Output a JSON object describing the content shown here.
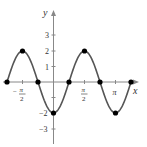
{
  "chart_data": {
    "type": "line",
    "function": "y = -2cos(2x)",
    "title": "",
    "xlabel": "x",
    "ylabel": "y",
    "xlim": [
      -2.356,
      3.927
    ],
    "ylim": [
      -3.5,
      3.5
    ],
    "grid": false,
    "x_ticks": [
      {
        "value": -1.5708,
        "label_num": "π",
        "label_den": "2",
        "sign": "−"
      },
      {
        "value": 1.5708,
        "label_num": "π",
        "label_den": "2",
        "sign": ""
      },
      {
        "value": 3.1416,
        "label": "π"
      }
    ],
    "y_ticks": [
      {
        "value": 3,
        "label": "3"
      },
      {
        "value": 2,
        "label": "2"
      },
      {
        "value": 1,
        "label": "1"
      },
      {
        "value": -1,
        "label": ""
      },
      {
        "value": -2,
        "label": "−2"
      },
      {
        "value": -3,
        "label": "−3"
      }
    ],
    "points": [
      {
        "x": -2.356,
        "y": 0
      },
      {
        "x": -1.5708,
        "y": 2
      },
      {
        "x": -0.7854,
        "y": 0
      },
      {
        "x": 0,
        "y": -2
      },
      {
        "x": 0.7854,
        "y": 0
      },
      {
        "x": 1.5708,
        "y": 2
      },
      {
        "x": 2.356,
        "y": 0
      },
      {
        "x": 3.1416,
        "y": -2
      },
      {
        "x": 3.927,
        "y": 0
      }
    ],
    "colors": {
      "curve": "#555555",
      "points": "#000000",
      "axes": "#777777"
    }
  },
  "labels": {
    "x_axis": "x",
    "y_axis": "y",
    "y3": "3",
    "y2": "2",
    "y1": "1",
    "yn2": "−2",
    "yn3": "−3",
    "pi": "π",
    "two": "2",
    "minus": "−"
  }
}
